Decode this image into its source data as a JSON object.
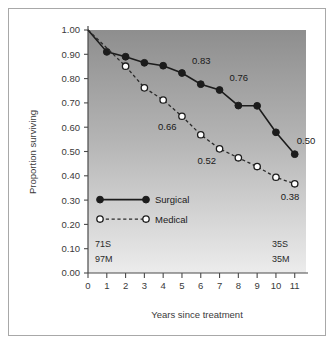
{
  "chart_data": {
    "type": "line",
    "title": "",
    "xlabel": "Years since treatment",
    "ylabel": "Proportion surviving",
    "xlim": [
      0,
      11.6
    ],
    "ylim": [
      0,
      1.0
    ],
    "x": [
      0,
      1,
      2,
      3,
      4,
      5,
      6,
      7,
      8,
      9,
      10,
      11
    ],
    "xtick_labels": [
      "0",
      "1",
      "2",
      "3",
      "4",
      "5",
      "6",
      "7",
      "8",
      "9",
      "10",
      "11"
    ],
    "ytick_labels": [
      "0.00",
      "0.10",
      "0.20",
      "0.30",
      "0.40",
      "0.50",
      "0.60",
      "0.70",
      "0.80",
      "0.90",
      "1.00"
    ],
    "ytick_values": [
      0.0,
      0.1,
      0.2,
      0.3,
      0.4,
      0.5,
      0.6,
      0.7,
      0.8,
      0.9,
      1.0
    ],
    "grid": false,
    "legend_position": "lower-left",
    "series": [
      {
        "name": "Surgical",
        "style": "solid",
        "marker": "filled-circle",
        "color": "#1c1c1c",
        "x": [
          0,
          1,
          2,
          3,
          4,
          5,
          6,
          7,
          8,
          9,
          10,
          11
        ],
        "values": [
          1.0,
          0.91,
          0.89,
          0.865,
          0.853,
          0.823,
          0.777,
          0.753,
          0.689,
          0.688,
          0.579,
          0.489
        ],
        "marker_at": [
          1,
          2,
          3,
          4,
          5,
          6,
          7,
          8,
          9,
          10,
          11
        ]
      },
      {
        "name": "Medical",
        "style": "dashed",
        "marker": "open-circle",
        "color": "#2a2a2a",
        "x": [
          0,
          2,
          3,
          4,
          5,
          6,
          7,
          8,
          9,
          10,
          11
        ],
        "values": [
          1.0,
          0.851,
          0.762,
          0.712,
          0.645,
          0.569,
          0.511,
          0.474,
          0.438,
          0.394,
          0.367
        ],
        "marker_at": [
          2,
          3,
          4,
          5,
          6,
          7,
          8,
          9,
          10,
          11
        ]
      }
    ],
    "annotations": [
      {
        "text": "0.83",
        "x": 5,
        "y": 0.823,
        "series": "Surgical",
        "dx": 10,
        "dy": -9
      },
      {
        "text": "0.76",
        "x": 7,
        "y": 0.753,
        "series": "Surgical",
        "dx": 10,
        "dy": -9
      },
      {
        "text": "0.50",
        "x": 11,
        "y": 0.489,
        "series": "Surgical",
        "dx": 2,
        "dy": -10
      },
      {
        "text": "0.66",
        "x": 5,
        "y": 0.645,
        "series": "Medical",
        "dx": -24,
        "dy": 14
      },
      {
        "text": "0.52",
        "x": 7,
        "y": 0.511,
        "series": "Medical",
        "dx": -22,
        "dy": 15
      },
      {
        "text": "0.38",
        "x": 11,
        "y": 0.367,
        "series": "Medical",
        "dx": -14,
        "dy": 16
      }
    ],
    "at_risk": {
      "left": {
        "surgical": "71S",
        "medical": "97M"
      },
      "right": {
        "surgical": "35S",
        "medical": "35M"
      }
    },
    "background": {
      "gradient_top": "#8e8e8e",
      "gradient_bottom": "#e8e8e8"
    }
  },
  "legend": {
    "entries": [
      {
        "label": "Surgical"
      },
      {
        "label": "Medical"
      }
    ]
  }
}
